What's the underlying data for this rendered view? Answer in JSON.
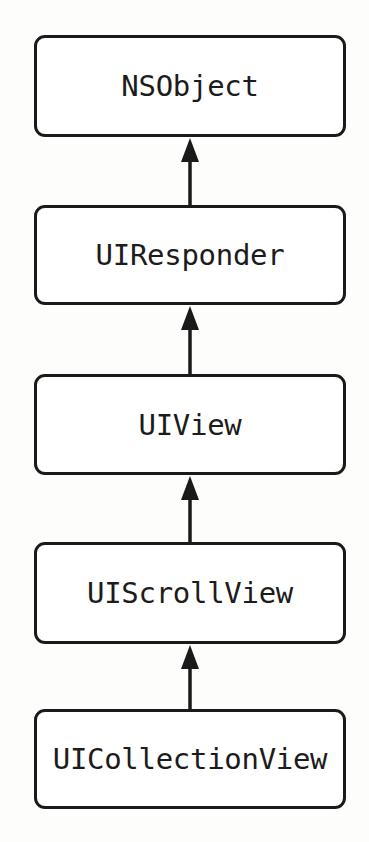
{
  "diagram": {
    "type": "inheritance-chain",
    "nodes": [
      {
        "id": "nsobject",
        "label": "NSObject"
      },
      {
        "id": "uiresponder",
        "label": "UIResponder"
      },
      {
        "id": "uiview",
        "label": "UIView"
      },
      {
        "id": "uiscrollview",
        "label": "UIScrollView"
      },
      {
        "id": "uicollectionview",
        "label": "UICollectionView"
      }
    ],
    "edges": [
      {
        "from": "UIResponder",
        "to": "NSObject",
        "relation": "inherits-from"
      },
      {
        "from": "UIView",
        "to": "UIResponder",
        "relation": "inherits-from"
      },
      {
        "from": "UIScrollView",
        "to": "UIView",
        "relation": "inherits-from"
      },
      {
        "from": "UICollectionView",
        "to": "UIScrollView",
        "relation": "inherits-from"
      }
    ],
    "colors": {
      "stroke": "#1a1a1a",
      "text": "#1c1c1c",
      "box_fill": "#ffffff",
      "background": "#fdfdfc"
    }
  }
}
